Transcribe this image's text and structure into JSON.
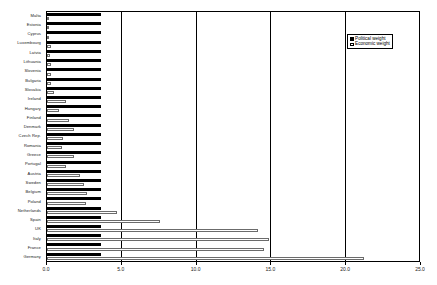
{
  "chart_data": {
    "type": "bar",
    "orientation": "horizontal",
    "title": "",
    "xlabel": "",
    "ylabel": "",
    "xlim": [
      0.0,
      25.0
    ],
    "xticks": [
      "0.0",
      "5.0",
      "10.0",
      "15.0",
      "20.0",
      "25.0"
    ],
    "xtick_values": [
      0.0,
      5.0,
      10.0,
      15.0,
      20.0,
      25.0
    ],
    "grid": true,
    "grid_axis": "x",
    "legend_position": "top-right",
    "categories": [
      "Malta",
      "Estonia",
      "Cyprus",
      "Luxembourg",
      "Latvia",
      "Lithuania",
      "Slovenia",
      "Bulgaria",
      "Slovakia",
      "Ireland",
      "Hungary",
      "Finland",
      "Denmark",
      "Czech Rep.",
      "Romania",
      "Greece",
      "Portugal",
      "Austria",
      "Sweden",
      "Belgium",
      "Poland",
      "Netherlands",
      "Spain",
      "UK",
      "Italy",
      "France",
      "Germany"
    ],
    "series": [
      {
        "name": "Political weight",
        "color": "#000000",
        "values": [
          3.62,
          3.62,
          3.62,
          3.62,
          3.62,
          3.62,
          3.62,
          3.62,
          3.62,
          3.62,
          3.62,
          3.62,
          3.62,
          3.62,
          3.62,
          3.62,
          3.62,
          3.62,
          3.62,
          3.62,
          3.62,
          3.62,
          3.62,
          3.62,
          3.62,
          3.62,
          3.62
        ]
      },
      {
        "name": "Economic weight",
        "color": "#ffffff",
        "values": [
          0.05,
          0.12,
          0.14,
          0.28,
          0.17,
          0.25,
          0.28,
          0.27,
          0.5,
          1.3,
          0.8,
          1.5,
          1.8,
          1.1,
          1.0,
          1.8,
          1.3,
          2.2,
          2.5,
          2.7,
          2.6,
          4.7,
          7.6,
          14.2,
          14.9,
          14.6,
          21.3
        ]
      }
    ]
  },
  "legend": {
    "items": [
      {
        "label": "Political weight",
        "swatch": "filled-square-icon"
      },
      {
        "label": "Economic weight",
        "swatch": "open-square-icon"
      }
    ]
  }
}
